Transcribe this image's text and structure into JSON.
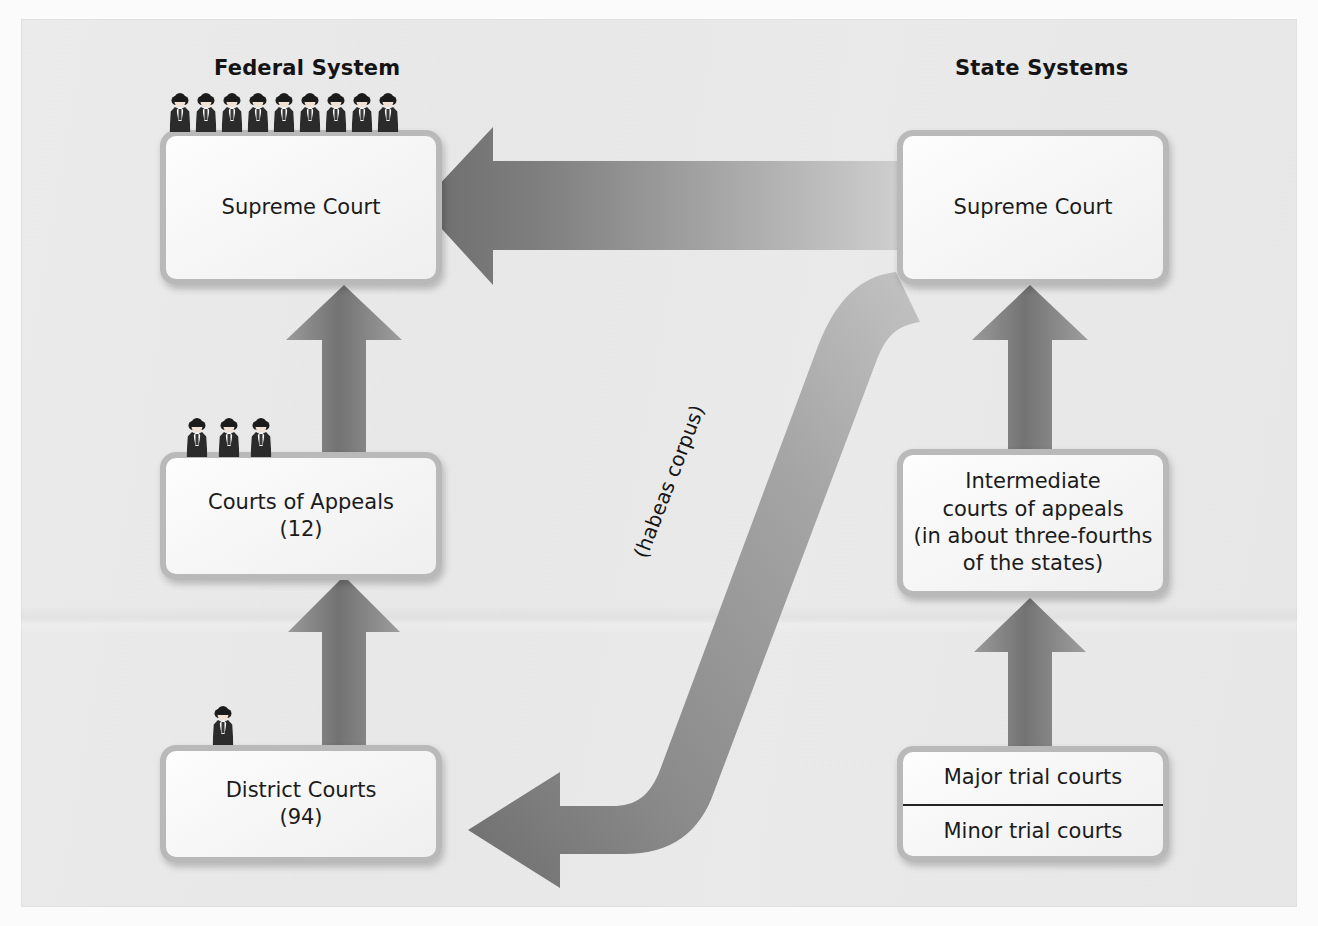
{
  "diagram": {
    "title_federal": "Federal System",
    "title_state": "State Systems",
    "habeas_label": "(habeas corpus)"
  },
  "federal": {
    "supreme_court": {
      "label": "Supreme Court",
      "judges": 9
    },
    "courts_of_appeals": {
      "line1": "Courts of Appeals",
      "line2": "(12)",
      "judges": 3
    },
    "district_courts": {
      "line1": "District Courts",
      "line2": "(94)",
      "judges": 1
    }
  },
  "state": {
    "supreme_court": {
      "label": "Supreme Court"
    },
    "intermediate": {
      "line1": "Intermediate",
      "line2": "courts of appeals",
      "line3": "(in about three-fourths",
      "line4": "of the states)"
    },
    "trial_courts": {
      "major": "Major trial courts",
      "minor": "Minor trial courts"
    }
  },
  "colors": {
    "arrow": "#8a8a8a",
    "arrow_dark": "#6f6f6f",
    "box_border": "#b9b9b9",
    "background": "#ececec",
    "text": "#1b1b1b"
  }
}
